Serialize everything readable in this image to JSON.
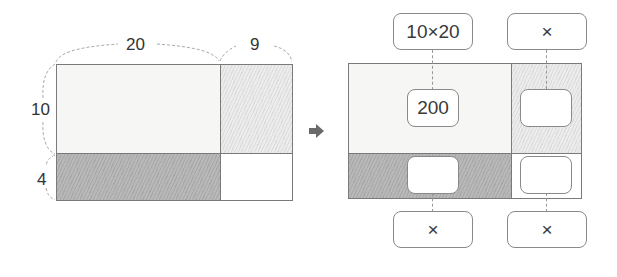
{
  "left_figure": {
    "width_labels": [
      "20",
      "9"
    ],
    "height_labels": [
      "10",
      "4"
    ]
  },
  "arrow": {
    "icon": "right-arrow-icon"
  },
  "right_figure": {
    "top_boxes": [
      "10×20",
      "×"
    ],
    "bottom_boxes": [
      "×",
      "×"
    ],
    "inner_boxes": [
      "200",
      "",
      "",
      ""
    ]
  }
}
